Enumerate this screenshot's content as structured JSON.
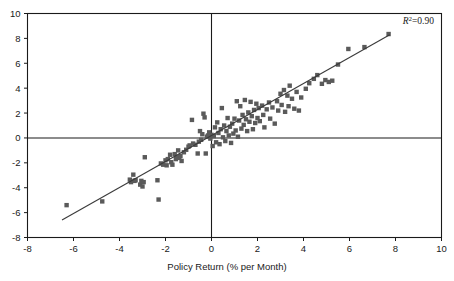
{
  "chart_data": {
    "type": "scatter",
    "title": "",
    "xlabel": "Policy Return (% per Month)",
    "ylabel": "",
    "xlim": [
      -8,
      10
    ],
    "ylim": [
      -8,
      10
    ],
    "xticks": [
      -8,
      -6,
      -4,
      -2,
      0,
      2,
      4,
      6,
      8,
      10
    ],
    "yticks": [
      -8,
      -6,
      -4,
      -2,
      0,
      2,
      4,
      6,
      8,
      10
    ],
    "xtick_labels": [
      "-8",
      "-6",
      "-4",
      "-2",
      "0",
      "2",
      "4",
      "6",
      "8",
      "10"
    ],
    "ytick_labels": [
      "-8",
      "-6",
      "-4",
      "-2",
      "0",
      "2",
      "4",
      "6",
      "8",
      "10"
    ],
    "grid": false,
    "legend": null,
    "annotations": [
      {
        "name": "r-squared",
        "text_italic": "R",
        "text_superscript": "2",
        "text_rest": "=0.90",
        "full_text": "R2=0.90",
        "value": 0.9,
        "position": "top-right"
      }
    ],
    "reference_lines": [
      {
        "name": "zero-vertical",
        "axis": "x",
        "value": 0
      },
      {
        "name": "zero-horizontal",
        "axis": "y",
        "value": 0
      }
    ],
    "fit_line": {
      "name": "regression-line",
      "type": "linear",
      "x_start": -6.5,
      "y_start": -6.6,
      "x_end": 7.75,
      "y_end": 8.3,
      "slope": 1.045,
      "intercept": 0.19,
      "color": "#3a3a3a"
    },
    "marker": {
      "shape": "square",
      "size_px": 4.4,
      "color": "#5a5a5a"
    },
    "series": [
      {
        "name": "Fund vs Policy Return",
        "points": [
          [
            -6.3,
            -5.4
          ],
          [
            -4.75,
            -5.1
          ],
          [
            -3.55,
            -3.35
          ],
          [
            -3.5,
            -3.55
          ],
          [
            -3.4,
            -2.95
          ],
          [
            -3.35,
            -3.45
          ],
          [
            -3.3,
            -3.4
          ],
          [
            -3.1,
            -3.75
          ],
          [
            -3.05,
            -3.45
          ],
          [
            -3.0,
            -3.9
          ],
          [
            -2.95,
            -3.55
          ],
          [
            -2.9,
            -1.55
          ],
          [
            -2.35,
            -3.4
          ],
          [
            -2.3,
            -4.95
          ],
          [
            -2.2,
            -2.05
          ],
          [
            -2.1,
            -2.15
          ],
          [
            -2.0,
            -1.8
          ],
          [
            -1.95,
            -2.2
          ],
          [
            -1.9,
            -1.7
          ],
          [
            -1.8,
            -1.35
          ],
          [
            -1.75,
            -1.95
          ],
          [
            -1.7,
            -2.15
          ],
          [
            -1.6,
            -1.3
          ],
          [
            -1.55,
            -1.7
          ],
          [
            -1.5,
            -1.55
          ],
          [
            -1.45,
            -1.0
          ],
          [
            -1.4,
            -1.6
          ],
          [
            -1.35,
            -1.45
          ],
          [
            -1.3,
            -1.85
          ],
          [
            -1.2,
            -1.15
          ],
          [
            -1.1,
            -0.95
          ],
          [
            -1.0,
            -0.7
          ],
          [
            -0.95,
            -0.6
          ],
          [
            -0.85,
            1.45
          ],
          [
            -0.8,
            -0.45
          ],
          [
            -0.7,
            -0.55
          ],
          [
            -0.6,
            -1.25
          ],
          [
            -0.55,
            -0.3
          ],
          [
            -0.5,
            0.55
          ],
          [
            -0.45,
            -0.15
          ],
          [
            -0.4,
            0.3
          ],
          [
            -0.35,
            1.95
          ],
          [
            -0.3,
            1.65
          ],
          [
            -0.25,
            -1.25
          ],
          [
            -0.2,
            0.1
          ],
          [
            -0.15,
            0.2
          ],
          [
            -0.1,
            0.45
          ],
          [
            -0.05,
            -0.05
          ],
          [
            0.0,
            0.25
          ],
          [
            0.05,
            -0.65
          ],
          [
            0.1,
            0.15
          ],
          [
            0.15,
            0.85
          ],
          [
            0.2,
            -0.35
          ],
          [
            0.25,
            1.25
          ],
          [
            0.3,
            0.4
          ],
          [
            0.35,
            -0.5
          ],
          [
            0.4,
            0.7
          ],
          [
            0.45,
            2.4
          ],
          [
            0.5,
            0.05
          ],
          [
            0.55,
            1.0
          ],
          [
            0.6,
            -0.25
          ],
          [
            0.65,
            0.55
          ],
          [
            0.7,
            1.6
          ],
          [
            0.75,
            0.2
          ],
          [
            0.8,
            0.9
          ],
          [
            0.85,
            -0.4
          ],
          [
            0.9,
            1.15
          ],
          [
            0.95,
            0.35
          ],
          [
            1.0,
            1.55
          ],
          [
            1.05,
            0.6
          ],
          [
            1.1,
            2.95
          ],
          [
            1.15,
            0.1
          ],
          [
            1.2,
            1.4
          ],
          [
            1.25,
            2.55
          ],
          [
            1.3,
            0.75
          ],
          [
            1.35,
            1.85
          ],
          [
            1.4,
            1.05
          ],
          [
            1.45,
            3.05
          ],
          [
            1.5,
            1.5
          ],
          [
            1.55,
            0.55
          ],
          [
            1.6,
            2.05
          ],
          [
            1.65,
            1.3
          ],
          [
            1.7,
            2.9
          ],
          [
            1.75,
            1.75
          ],
          [
            1.8,
            0.7
          ],
          [
            1.85,
            2.25
          ],
          [
            1.9,
            1.2
          ],
          [
            1.95,
            2.75
          ],
          [
            2.0,
            1.6
          ],
          [
            2.05,
            2.4
          ],
          [
            2.1,
            1.35
          ],
          [
            2.2,
            2.6
          ],
          [
            2.25,
            1.85
          ],
          [
            2.3,
            0.85
          ],
          [
            2.4,
            2.3
          ],
          [
            2.5,
            2.85
          ],
          [
            2.55,
            1.55
          ],
          [
            2.65,
            2.45
          ],
          [
            2.75,
            1.15
          ],
          [
            2.85,
            2.95
          ],
          [
            2.9,
            2.2
          ],
          [
            3.0,
            3.55
          ],
          [
            3.05,
            2.65
          ],
          [
            3.15,
            3.85
          ],
          [
            3.2,
            2.1
          ],
          [
            3.3,
            3.4
          ],
          [
            3.35,
            2.55
          ],
          [
            3.4,
            4.2
          ],
          [
            3.5,
            3.15
          ],
          [
            3.6,
            2.35
          ],
          [
            3.7,
            3.7
          ],
          [
            3.8,
            2.2
          ],
          [
            3.9,
            3.25
          ],
          [
            4.1,
            3.95
          ],
          [
            4.25,
            4.4
          ],
          [
            4.45,
            4.75
          ],
          [
            4.6,
            5.05
          ],
          [
            4.8,
            4.35
          ],
          [
            4.95,
            4.65
          ],
          [
            5.1,
            4.5
          ],
          [
            5.25,
            4.6
          ],
          [
            5.5,
            5.9
          ],
          [
            5.95,
            7.15
          ],
          [
            6.65,
            7.3
          ],
          [
            7.7,
            8.35
          ]
        ]
      }
    ]
  },
  "axes": {
    "x_axis_name": "x-axis",
    "y_axis_name": "y-axis"
  }
}
